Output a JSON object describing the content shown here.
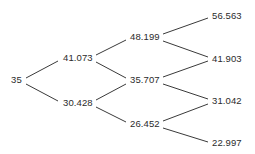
{
  "diagram": {
    "type": "binomial-lattice",
    "title": "",
    "background_color": "#ffffff",
    "line_color": "#3a3a3a",
    "text_color": "#2b2b2b",
    "steps": 3,
    "nodes": [
      {
        "id": "n0",
        "label": "35",
        "value": 35,
        "step": 0,
        "level": 0,
        "x": 11,
        "y": 80
      },
      {
        "id": "n1u",
        "label": "41.073",
        "value": 41.073,
        "step": 1,
        "level": 1,
        "x": 63,
        "y": 58
      },
      {
        "id": "n1d",
        "label": "30.428",
        "value": 30.428,
        "step": 1,
        "level": 0,
        "x": 63,
        "y": 103
      },
      {
        "id": "n2uu",
        "label": "48.199",
        "value": 48.199,
        "step": 2,
        "level": 2,
        "x": 130,
        "y": 37
      },
      {
        "id": "n2ud",
        "label": "35.707",
        "value": 35.707,
        "step": 2,
        "level": 1,
        "x": 130,
        "y": 80
      },
      {
        "id": "n2dd",
        "label": "26.452",
        "value": 26.452,
        "step": 2,
        "level": 0,
        "x": 130,
        "y": 124
      },
      {
        "id": "n3a",
        "label": "56.563",
        "value": 56.563,
        "step": 3,
        "level": 3,
        "x": 212,
        "y": 16
      },
      {
        "id": "n3b",
        "label": "41.903",
        "value": 41.903,
        "step": 3,
        "level": 2,
        "x": 212,
        "y": 59
      },
      {
        "id": "n3c",
        "label": "31.042",
        "value": 31.042,
        "step": 3,
        "level": 1,
        "x": 212,
        "y": 101
      },
      {
        "id": "n3d",
        "label": "22.997",
        "value": 22.997,
        "step": 3,
        "level": 0,
        "x": 212,
        "y": 143
      }
    ],
    "edges": [
      {
        "from": "n0",
        "to": "n1u",
        "x1": 26,
        "y1": 78,
        "x2": 58,
        "y2": 61
      },
      {
        "from": "n0",
        "to": "n1d",
        "x1": 26,
        "y1": 84,
        "x2": 58,
        "y2": 101
      },
      {
        "from": "n1u",
        "to": "n2uu",
        "x1": 96,
        "y1": 55,
        "x2": 126,
        "y2": 40
      },
      {
        "from": "n1u",
        "to": "n2ud",
        "x1": 96,
        "y1": 62,
        "x2": 126,
        "y2": 78
      },
      {
        "from": "n1d",
        "to": "n2ud",
        "x1": 96,
        "y1": 100,
        "x2": 126,
        "y2": 84
      },
      {
        "from": "n1d",
        "to": "n2dd",
        "x1": 96,
        "y1": 107,
        "x2": 126,
        "y2": 122
      },
      {
        "from": "n2uu",
        "to": "n3a",
        "x1": 163,
        "y1": 34,
        "x2": 208,
        "y2": 18
      },
      {
        "from": "n2uu",
        "to": "n3b",
        "x1": 163,
        "y1": 41,
        "x2": 208,
        "y2": 57
      },
      {
        "from": "n2ud",
        "to": "n3b",
        "x1": 163,
        "y1": 77,
        "x2": 208,
        "y2": 61
      },
      {
        "from": "n2ud",
        "to": "n3c",
        "x1": 163,
        "y1": 84,
        "x2": 208,
        "y2": 99
      },
      {
        "from": "n2dd",
        "to": "n3c",
        "x1": 163,
        "y1": 121,
        "x2": 208,
        "y2": 104
      },
      {
        "from": "n2dd",
        "to": "n3d",
        "x1": 163,
        "y1": 128,
        "x2": 208,
        "y2": 142
      }
    ]
  }
}
